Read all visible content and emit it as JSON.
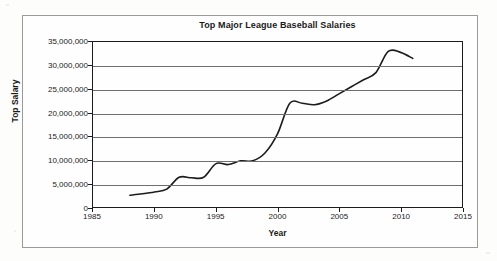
{
  "chart_data": {
    "type": "line",
    "title": "Top Major League Baseball Salaries",
    "xlabel": "Year",
    "ylabel": "Top Salary",
    "xlim": [
      1985,
      2015
    ],
    "ylim": [
      0,
      35000000
    ],
    "grid": true,
    "legend": "none",
    "x_ticks": [
      "1985",
      "1990",
      "1995",
      "2000",
      "2005",
      "2010",
      "2015"
    ],
    "x_tick_values": [
      1985,
      1990,
      1995,
      2000,
      2005,
      2010,
      2015
    ],
    "y_ticks": [
      "0",
      "5,000,000",
      "10,000,000",
      "15,000,000",
      "20,000,000",
      "25,000,000",
      "30,000,000",
      "35,000,000"
    ],
    "y_tick_values": [
      0,
      5000000,
      10000000,
      15000000,
      20000000,
      25000000,
      30000000,
      35000000
    ],
    "series": [
      {
        "name": "Top Salary",
        "color": "#1c1c1c",
        "x": [
          1988,
          1989,
          1990,
          1991,
          1992,
          1993,
          1994,
          1995,
          1996,
          1997,
          1998,
          1999,
          2000,
          2001,
          2002,
          2003,
          2004,
          2005,
          2006,
          2007,
          2008,
          2009,
          2010,
          2011
        ],
        "values": [
          2500000,
          2800000,
          3200000,
          3800000,
          6300000,
          6200000,
          6300000,
          9200000,
          9000000,
          9800000,
          9800000,
          11500000,
          15500000,
          22000000,
          22000000,
          21700000,
          22500000,
          24000000,
          25500000,
          27000000,
          28500000,
          33000000,
          32800000,
          31500000
        ]
      }
    ]
  }
}
